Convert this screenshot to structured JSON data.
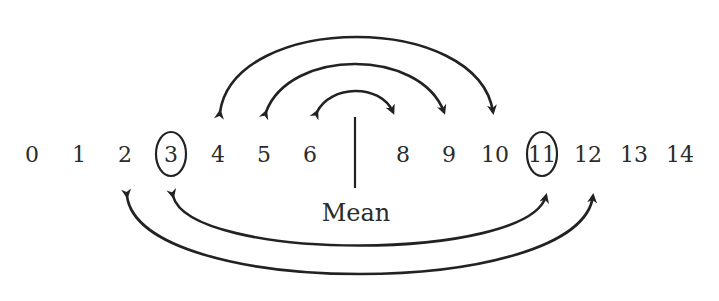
{
  "number_line": {
    "numbers": [
      {
        "label": "0",
        "x": 32
      },
      {
        "label": "1",
        "x": 79
      },
      {
        "label": "2",
        "x": 125
      },
      {
        "label": "3",
        "x": 171,
        "circled": true
      },
      {
        "label": "4",
        "x": 218
      },
      {
        "label": "5",
        "x": 264
      },
      {
        "label": "6",
        "x": 310
      },
      {
        "label": "8",
        "x": 403
      },
      {
        "label": "9",
        "x": 449
      },
      {
        "label": "10",
        "x": 495
      },
      {
        "label": "11",
        "x": 542,
        "circled": true
      },
      {
        "label": "12",
        "x": 588
      },
      {
        "label": "13",
        "x": 634
      },
      {
        "label": "14",
        "x": 680
      }
    ],
    "mean_label": "Mean",
    "mean_value": 7
  },
  "arrows_above": [
    {
      "from": "6",
      "to": "8"
    },
    {
      "from": "5",
      "to": "9"
    },
    {
      "from": "4",
      "to": "10"
    }
  ],
  "arrows_below": [
    {
      "from": "3",
      "to": "11"
    },
    {
      "from": "2",
      "to": "12"
    }
  ],
  "circled_values": [
    "3",
    "11"
  ],
  "colors": {
    "ink": "#222222",
    "background": "#ffffff"
  }
}
